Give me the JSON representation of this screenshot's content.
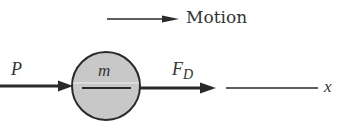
{
  "diagram": {
    "legend": {
      "label": "Motion",
      "direction": "right"
    },
    "body": {
      "label": "m",
      "shape": "circle",
      "fill": "#c8c8c8",
      "stroke": "#2a2a2a"
    },
    "forces": [
      {
        "label": "P",
        "subscript": "",
        "direction": "right",
        "side": "left"
      },
      {
        "label": "F",
        "subscript": "D",
        "direction": "right",
        "side": "right"
      }
    ],
    "axis": {
      "label": "x"
    },
    "colors": {
      "ink": "#2a2a2a",
      "fill": "#c8c8c8",
      "background": "#ffffff"
    }
  }
}
